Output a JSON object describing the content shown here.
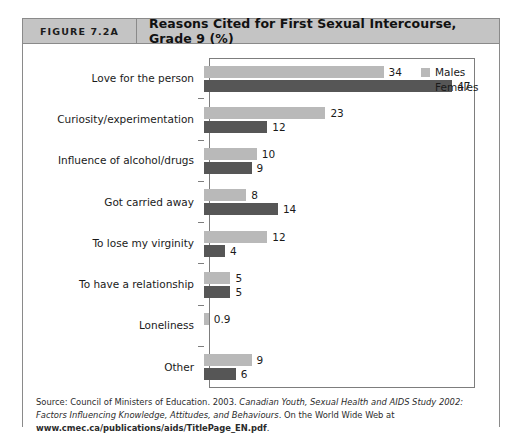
{
  "figure": {
    "number_label": "FIGURE 7.2A",
    "title": "Reasons Cited for First Sexual Intercourse, Grade 9 (%)"
  },
  "legend": {
    "males_label": "Males",
    "females_label": "Females",
    "males_color": "#b9b9b9",
    "females_color": "#565656"
  },
  "source": {
    "prefix": "Source: Council of Ministers of Education. 2003. ",
    "italic_title": "Canadian Youth, Sexual Health and AIDS Study 2002: Factors Influencing Knowledge, Attitudes, and Behaviours",
    "middle": ". On the World Wide Web at ",
    "url": "www.cmec.ca/publications/aids/TitlePage_EN.pdf",
    "suffix": "."
  },
  "chart_data": {
    "type": "bar",
    "orientation": "horizontal",
    "title": "Reasons Cited for First Sexual Intercourse, Grade 9 (%)",
    "xlabel": "",
    "ylabel": "",
    "xlim": [
      0,
      50
    ],
    "grid": false,
    "legend_position": "top-right",
    "categories": [
      "Love for the person",
      "Curiosity/experimentation",
      "Influence of alcohol/drugs",
      "Got carried away",
      "To lose my virginity",
      "To have a relationship",
      "Loneliness",
      "Other"
    ],
    "series": [
      {
        "name": "Males",
        "color": "#b9b9b9",
        "values": [
          34,
          23,
          10,
          8,
          12,
          5,
          0.9,
          9
        ],
        "labels": [
          "34",
          "23",
          "10",
          "8",
          "12",
          "5",
          "0.9",
          "9"
        ]
      },
      {
        "name": "Females",
        "color": "#565656",
        "values": [
          47,
          12,
          9,
          14,
          4,
          5,
          null,
          6
        ],
        "labels": [
          "47",
          "12",
          "9",
          "14",
          "4",
          "5",
          "",
          "6"
        ]
      }
    ]
  }
}
